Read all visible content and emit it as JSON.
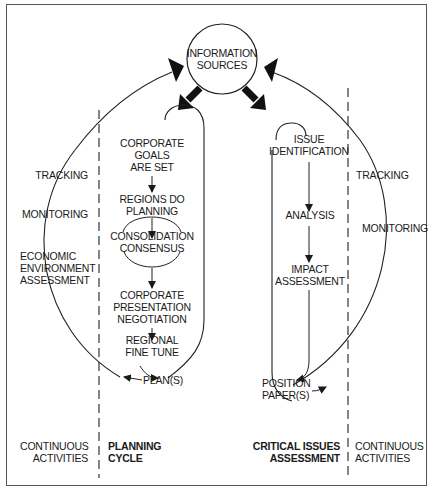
{
  "hub": {
    "line1": "INFORMATION",
    "line2": "SOURCES"
  },
  "planning_cycle": {
    "steps": [
      {
        "line1": "CORPORATE",
        "line2": "GOALS",
        "line3": "ARE SET"
      },
      {
        "line1": "REGIONS DO",
        "line2": "PLANNING"
      },
      {
        "line1": "CONSOLIDATION",
        "line2": "CONSENSUS"
      },
      {
        "line1": "CORPORATE",
        "line2": "PRESENTATION",
        "line3": "NEGOTIATION"
      },
      {
        "line1": "REGIONAL",
        "line2": "FINE TUNE"
      }
    ],
    "output": "PLAN(S)"
  },
  "critical_issues": {
    "steps": [
      {
        "line1": "ISSUE",
        "line2": "IDENTIFICATION"
      },
      {
        "line1": "ANALYSIS"
      },
      {
        "line1": "IMPACT",
        "line2": "ASSESSMENT"
      }
    ],
    "output": {
      "line1": "POSITION",
      "line2": "PAPER(S)"
    }
  },
  "left_activities": {
    "tracking": "TRACKING",
    "monitoring": "MONITORING",
    "economic": {
      "line1": "ECONOMIC",
      "line2": "ENVIRONMENT",
      "line3": "ASSESSMENT"
    }
  },
  "right_activities": {
    "tracking": "TRACKING",
    "monitoring": "MONITORING"
  },
  "footer": {
    "left": {
      "line1": "CONTINUOUS",
      "line2": "ACTIVITIES"
    },
    "planning": {
      "line1": "PLANNING",
      "line2": "CYCLE"
    },
    "critical": {
      "line1": "CRITICAL ISSUES",
      "line2": "ASSESSMENT"
    },
    "right": {
      "line1": "CONTINUOUS",
      "line2": "ACTIVITIES"
    }
  }
}
